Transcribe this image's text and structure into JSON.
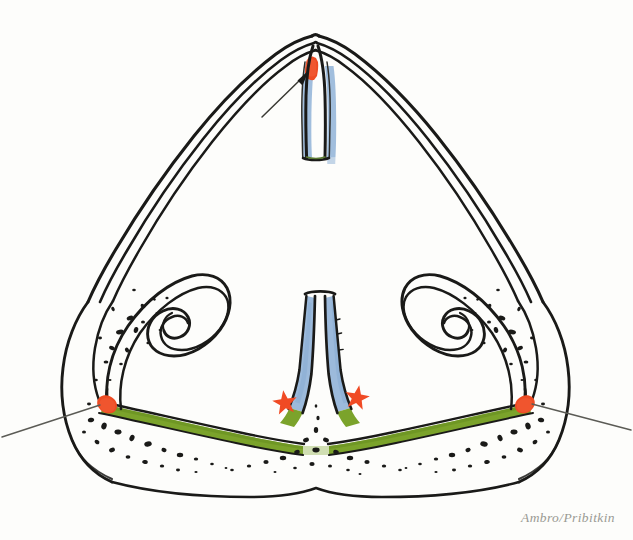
{
  "figure": {
    "signature": "Ambro/Pribitkin",
    "background_color": "#fdfdfb"
  },
  "palette": {
    "ink": "#1a1a18",
    "ink_light": "#2b2b27",
    "septum_blue": "#9cbadb",
    "floor_green": "#7ba32b",
    "highlight_red": "#ee4b23",
    "star_red": "#f04a24",
    "pointer_gray": "#5b5b55",
    "signature_gray": "#9a9a93",
    "paper": "#fdfdfb"
  },
  "structures": {
    "nasal_vault": {
      "name": "nasal-vault",
      "description": "Double-outlined triangular bony-cartilaginous vault forming the roof and lateral walls"
    },
    "upper_septum": {
      "name": "upper-septum",
      "description": "Superior septal cartilage with blue mucoperichondrium on both sides",
      "color": "#9cbadb"
    },
    "lower_septum": {
      "name": "lower-septum",
      "description": "Inferior septum flaring at its base, blue mucoperichondrium transitioning to green floor mucosa",
      "color": "#9cbadb"
    },
    "nasal_floor": {
      "name": "nasal-floor-mucosa",
      "description": "Green mucosal band running along the nasal floor from left to right lateral attachment",
      "color": "#7ba32b"
    },
    "left_turbinate": {
      "name": "left-inferior-turbinate",
      "description": "Scroll-shaped inferior turbinate curling inward, left side"
    },
    "right_turbinate": {
      "name": "right-inferior-turbinate",
      "description": "Scroll-shaped inferior turbinate curling inward, right side"
    },
    "bone_stipple": {
      "name": "cancellous-bone-stipple",
      "description": "Stippled speckle texture indicating cancellous maxillary bone"
    }
  },
  "annotations": {
    "top_highlight": {
      "name": "superior-septal-highlight",
      "color": "#ee4b23",
      "description": "Red highlighted region at the superior septal angle / keystone area"
    },
    "left_highlight": {
      "name": "left-turbinate-attachment-highlight",
      "color": "#ee4b23",
      "description": "Red highlighted attachment of the left turbinate to the lateral wall"
    },
    "right_highlight": {
      "name": "right-turbinate-attachment-highlight",
      "color": "#ee4b23",
      "description": "Red highlighted attachment of the right turbinate to the lateral wall"
    },
    "top_arrow": {
      "name": "superior-septum-pointer-arrow",
      "description": "Solid-headed arrow pointing up-right to the superior septal highlight"
    },
    "left_pointer": {
      "name": "left-attachment-pointer-line",
      "description": "Thin leader line entering from the left margin to the left highlight"
    },
    "right_pointer": {
      "name": "right-attachment-pointer-line",
      "description": "Thin leader line entering from the right margin to the right highlight"
    },
    "star_left": {
      "name": "left-star-marker",
      "color": "#f04a24",
      "description": "Five-pointed star marking the left inferior septal base"
    },
    "star_right": {
      "name": "right-star-marker",
      "color": "#f04a24",
      "description": "Five-pointed star marking the right inferior septal base"
    }
  }
}
